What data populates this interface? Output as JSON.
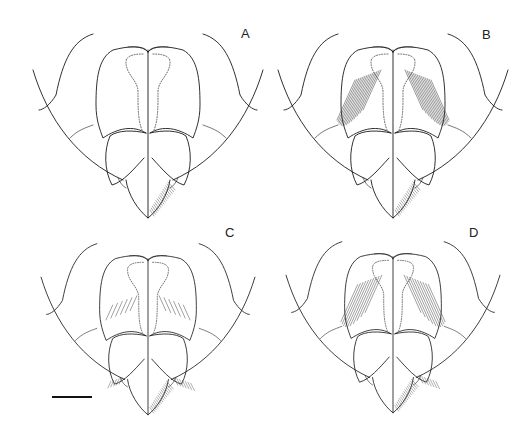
{
  "figure": {
    "panels": [
      {
        "id": "A",
        "label": "A",
        "hatching": "none",
        "dotted_outline": true,
        "setae": "dense-right-tip"
      },
      {
        "id": "B",
        "label": "B",
        "hatching": "dense-long",
        "dotted_outline": true,
        "setae": "right-tip"
      },
      {
        "id": "C",
        "label": "C",
        "hatching": "short-sparse",
        "dotted_outline": true,
        "setae": "both-sides-tip"
      },
      {
        "id": "D",
        "label": "D",
        "hatching": "long",
        "dotted_outline": true,
        "setae": "right-lateral-and-tip"
      }
    ],
    "scale_bar": {
      "label": ""
    }
  }
}
